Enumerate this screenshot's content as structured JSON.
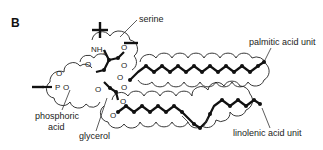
{
  "figure": {
    "panel_label": "B",
    "labels": {
      "serine": "serine",
      "palmitic": "palmitic acid unit",
      "phosphoric_line1": "phosphoric",
      "phosphoric_line2": "acid",
      "glycerol": "glycerol",
      "linolenic": "linolenic acid unit"
    },
    "atoms": {
      "nh3": "NH",
      "nh3_sub": "3",
      "p": "P",
      "o": "O"
    },
    "charges": {
      "plus": "+",
      "minus": "−"
    }
  }
}
